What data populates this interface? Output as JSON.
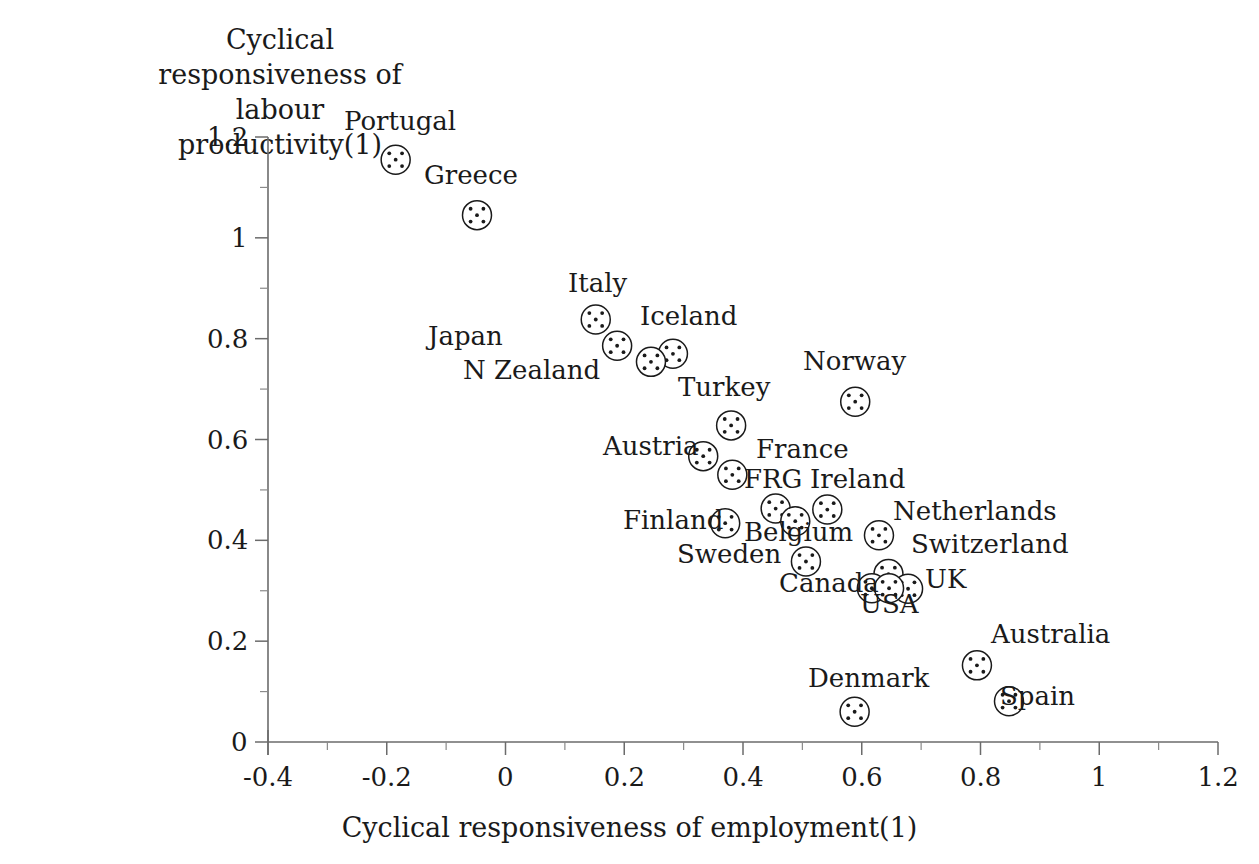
{
  "chart_data": {
    "type": "scatter",
    "title": "",
    "xlabel": "Cyclical responsiveness of employment(1)",
    "ylabel_lines": [
      "Cyclical",
      "responsiveness of",
      "labour productivity(1)"
    ],
    "ylabel": "Cyclical responsiveness of labour productivity(1)",
    "xlim": [
      -0.4,
      1.2
    ],
    "ylim": [
      0,
      1.2
    ],
    "xticks": [
      "-0.4",
      "-0.2",
      "0",
      "0.2",
      "0.4",
      "0.6",
      "0.8",
      "1",
      "1.2"
    ],
    "xtick_values": [
      -0.4,
      -0.2,
      0,
      0.2,
      0.4,
      0.6,
      0.8,
      1,
      1.2
    ],
    "yticks": [
      "0",
      "0.2",
      "0.4",
      "0.6",
      "0.8",
      "1",
      "1.2"
    ],
    "ytick_values": [
      0,
      0.2,
      0.4,
      0.6,
      0.8,
      1,
      1.2
    ],
    "minor_tick_step": 0.1,
    "grid": false,
    "legend": "none",
    "marker_style": "open-circle-with-five-dots",
    "points": [
      {
        "label": "Portugal",
        "x": -0.185,
        "y": 1.155,
        "lx": 344,
        "ly": 108,
        "la": "left"
      },
      {
        "label": "Greece",
        "x": -0.048,
        "y": 1.045,
        "lx": 424,
        "ly": 162,
        "la": "left"
      },
      {
        "label": "Italy",
        "x": 0.152,
        "y": 0.838,
        "lx": 568,
        "ly": 270,
        "la": "left"
      },
      {
        "label": "Japan",
        "x": 0.188,
        "y": 0.786,
        "lx": 428,
        "ly": 323,
        "la": "left"
      },
      {
        "label": "Iceland",
        "x": 0.282,
        "y": 0.77,
        "lx": 640,
        "ly": 303,
        "la": "left"
      },
      {
        "label": "N Zealand",
        "x": 0.245,
        "y": 0.754,
        "lx": 463,
        "ly": 357,
        "la": "left"
      },
      {
        "label": "Turkey",
        "x": 0.38,
        "y": 0.628,
        "lx": 678,
        "ly": 374,
        "la": "left"
      },
      {
        "label": "Norway",
        "x": 0.589,
        "y": 0.675,
        "lx": 803,
        "ly": 348,
        "la": "left"
      },
      {
        "label": "Austria",
        "x": 0.333,
        "y": 0.567,
        "lx": 603,
        "ly": 433,
        "la": "left"
      },
      {
        "label": "France",
        "x": 0.382,
        "y": 0.53,
        "lx": 756,
        "ly": 436,
        "la": "left"
      },
      {
        "label": "FRG",
        "x": 0.455,
        "y": 0.463,
        "lx": 744,
        "ly": 466,
        "la": "left"
      },
      {
        "label": "Ireland",
        "x": 0.542,
        "y": 0.461,
        "lx": 810,
        "ly": 466,
        "la": "left"
      },
      {
        "label": "Belgium",
        "x": 0.488,
        "y": 0.438,
        "lx": 744,
        "ly": 519,
        "la": "left"
      },
      {
        "label": "Finland",
        "x": 0.37,
        "y": 0.434,
        "lx": 623,
        "ly": 507,
        "la": "left"
      },
      {
        "label": "Netherlands",
        "x": 0.629,
        "y": 0.41,
        "lx": 893,
        "ly": 498,
        "la": "left"
      },
      {
        "label": "Sweden",
        "x": 0.506,
        "y": 0.358,
        "lx": 677,
        "ly": 541,
        "la": "left"
      },
      {
        "label": "Switzerland",
        "x": 0.645,
        "y": 0.333,
        "lx": 911,
        "ly": 531,
        "la": "left"
      },
      {
        "label": "UK",
        "x": 0.678,
        "y": 0.304,
        "lx": 925,
        "ly": 566,
        "la": "left"
      },
      {
        "label": "Canada",
        "x": 0.617,
        "y": 0.305,
        "lx": 779,
        "ly": 570,
        "la": "left"
      },
      {
        "label": "USA",
        "x": 0.646,
        "y": 0.305,
        "lx": 860,
        "ly": 591,
        "la": "left"
      },
      {
        "label": "Australia",
        "x": 0.794,
        "y": 0.152,
        "lx": 991,
        "ly": 621,
        "la": "left"
      },
      {
        "label": "Denmark",
        "x": 0.588,
        "y": 0.06,
        "lx": 808,
        "ly": 665,
        "la": "left"
      },
      {
        "label": "Spain",
        "x": 0.848,
        "y": 0.081,
        "lx": 1000,
        "ly": 683,
        "la": "left"
      }
    ]
  }
}
